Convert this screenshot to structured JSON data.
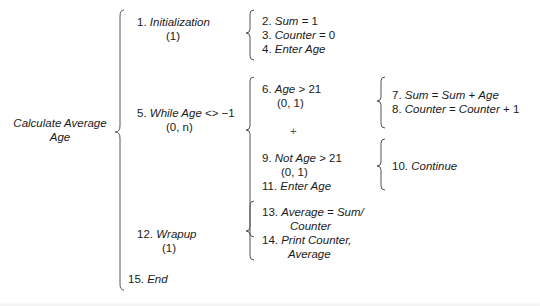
{
  "root": {
    "line1": "Calculate Average",
    "line2": "Age"
  },
  "level1": [
    {
      "num": "1.",
      "label": "Initialization",
      "mult": "(1)"
    },
    {
      "num": "5.",
      "label": "While Age",
      "op": "<> −1",
      "mult": "(0, n)"
    },
    {
      "num": "12.",
      "label": "Wrapup",
      "mult": "(1)"
    },
    {
      "num": "15.",
      "label": "End"
    }
  ],
  "init_steps": [
    {
      "num": "2.",
      "lhs": "Sum",
      "rhs": "= 1"
    },
    {
      "num": "3.",
      "lhs": "Counter",
      "rhs": "= 0"
    },
    {
      "num": "4.",
      "text": "Enter Age"
    }
  ],
  "while_steps": {
    "cond_true": {
      "num": "6.",
      "lhs": "Age",
      "rhs": "> 21",
      "mult": "(0, 1)"
    },
    "plus": "+",
    "cond_false": {
      "num": "9.",
      "lhs": "Not Age",
      "rhs": "> 21",
      "mult": "(0, 1)"
    },
    "enter": {
      "num": "11.",
      "text": "Enter Age"
    }
  },
  "true_actions": [
    {
      "num": "7.",
      "a": "Sum",
      "op1": "=",
      "b": "Sum",
      "op2": "+",
      "c": "Age"
    },
    {
      "num": "8.",
      "a": "Counter",
      "op1": "=",
      "b": "Counter",
      "op2": "+ 1"
    }
  ],
  "false_actions": [
    {
      "num": "10.",
      "text": "Continue"
    }
  ],
  "wrapup_steps": [
    {
      "num": "13.",
      "line1": "Average = Sum/",
      "line2": "Counter"
    },
    {
      "num": "14.",
      "line1": "Print Counter,",
      "line2": "Average"
    }
  ]
}
